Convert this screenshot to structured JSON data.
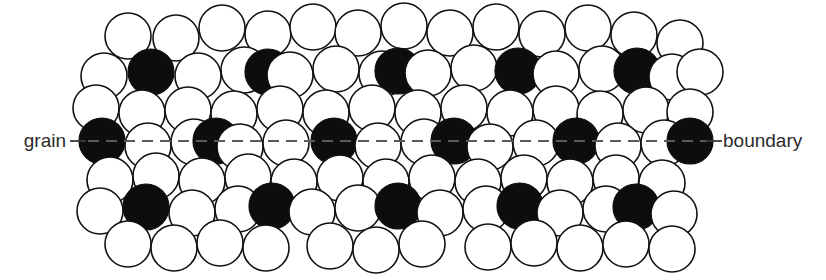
{
  "figure": {
    "width": 826,
    "height": 280,
    "background_color": "#ffffff"
  },
  "labels": {
    "left": {
      "text": "grain",
      "x": 66,
      "y": 147,
      "color": "#2b2b2b",
      "font_size": 19
    },
    "right": {
      "text": "boundary",
      "x": 723,
      "y": 147,
      "color": "#2b2b2b",
      "font_size": 19
    }
  },
  "leaders": {
    "color": "#3a3a3a",
    "left": {
      "x1": 70,
      "y1": 141,
      "x2": 86,
      "y2": 141
    },
    "right": {
      "x1": 706,
      "y1": 141,
      "x2": 722,
      "y2": 141
    }
  },
  "boundary_line": {
    "label": "grain boundary plane",
    "y": 141,
    "x_start": 88,
    "x_end": 706,
    "color": "#5a5a5a",
    "dash_pattern": "11 7",
    "stroke_width": 1.8
  },
  "atom_style": {
    "radius": 23,
    "open_fill": "#ffffff",
    "open_stroke": "#111111",
    "filled_fill": "#0d0d0d",
    "filled_stroke": "#0d0d0d"
  },
  "atoms": [
    {
      "cx": 128,
      "cy": 36,
      "filled": false
    },
    {
      "cx": 176,
      "cy": 38,
      "filled": false
    },
    {
      "cx": 222,
      "cy": 28,
      "filled": false
    },
    {
      "cx": 268,
      "cy": 34,
      "filled": false
    },
    {
      "cx": 313,
      "cy": 27,
      "filled": false
    },
    {
      "cx": 358,
      "cy": 33,
      "filled": false
    },
    {
      "cx": 404,
      "cy": 26,
      "filled": false
    },
    {
      "cx": 450,
      "cy": 33,
      "filled": false
    },
    {
      "cx": 496,
      "cy": 27,
      "filled": false
    },
    {
      "cx": 542,
      "cy": 34,
      "filled": false
    },
    {
      "cx": 588,
      "cy": 28,
      "filled": false
    },
    {
      "cx": 634,
      "cy": 35,
      "filled": false
    },
    {
      "cx": 680,
      "cy": 43,
      "filled": false
    },
    {
      "cx": 104,
      "cy": 76,
      "filled": false
    },
    {
      "cx": 151,
      "cy": 72,
      "filled": true
    },
    {
      "cx": 198,
      "cy": 76,
      "filled": false
    },
    {
      "cx": 244,
      "cy": 70,
      "filled": false
    },
    {
      "cx": 268,
      "cy": 72,
      "filled": true
    },
    {
      "cx": 290,
      "cy": 75,
      "filled": false
    },
    {
      "cx": 336,
      "cy": 69,
      "filled": false
    },
    {
      "cx": 382,
      "cy": 74,
      "filled": false
    },
    {
      "cx": 398,
      "cy": 71,
      "filled": true
    },
    {
      "cx": 428,
      "cy": 73,
      "filled": false
    },
    {
      "cx": 474,
      "cy": 68,
      "filled": false
    },
    {
      "cx": 518,
      "cy": 71,
      "filled": true
    },
    {
      "cx": 556,
      "cy": 74,
      "filled": false
    },
    {
      "cx": 602,
      "cy": 69,
      "filled": false
    },
    {
      "cx": 637,
      "cy": 71,
      "filled": true
    },
    {
      "cx": 672,
      "cy": 77,
      "filled": false
    },
    {
      "cx": 700,
      "cy": 72,
      "filled": false
    },
    {
      "cx": 96,
      "cy": 108,
      "filled": false
    },
    {
      "cx": 142,
      "cy": 113,
      "filled": false
    },
    {
      "cx": 188,
      "cy": 110,
      "filled": false
    },
    {
      "cx": 234,
      "cy": 114,
      "filled": false
    },
    {
      "cx": 280,
      "cy": 109,
      "filled": false
    },
    {
      "cx": 326,
      "cy": 113,
      "filled": false
    },
    {
      "cx": 372,
      "cy": 108,
      "filled": false
    },
    {
      "cx": 418,
      "cy": 113,
      "filled": false
    },
    {
      "cx": 464,
      "cy": 108,
      "filled": false
    },
    {
      "cx": 510,
      "cy": 113,
      "filled": false
    },
    {
      "cx": 556,
      "cy": 109,
      "filled": false
    },
    {
      "cx": 600,
      "cy": 114,
      "filled": false
    },
    {
      "cx": 646,
      "cy": 110,
      "filled": false
    },
    {
      "cx": 690,
      "cy": 112,
      "filled": false
    },
    {
      "cx": 102,
      "cy": 141,
      "filled": true
    },
    {
      "cx": 148,
      "cy": 146,
      "filled": false
    },
    {
      "cx": 194,
      "cy": 142,
      "filled": false
    },
    {
      "cx": 216,
      "cy": 141,
      "filled": true
    },
    {
      "cx": 240,
      "cy": 147,
      "filled": false
    },
    {
      "cx": 286,
      "cy": 143,
      "filled": false
    },
    {
      "cx": 334,
      "cy": 141,
      "filled": true
    },
    {
      "cx": 378,
      "cy": 146,
      "filled": false
    },
    {
      "cx": 424,
      "cy": 142,
      "filled": false
    },
    {
      "cx": 454,
      "cy": 141,
      "filled": true
    },
    {
      "cx": 490,
      "cy": 147,
      "filled": false
    },
    {
      "cx": 536,
      "cy": 143,
      "filled": false
    },
    {
      "cx": 576,
      "cy": 141,
      "filled": true
    },
    {
      "cx": 618,
      "cy": 146,
      "filled": false
    },
    {
      "cx": 664,
      "cy": 143,
      "filled": false
    },
    {
      "cx": 690,
      "cy": 141,
      "filled": true
    },
    {
      "cx": 110,
      "cy": 180,
      "filled": false
    },
    {
      "cx": 156,
      "cy": 176,
      "filled": false
    },
    {
      "cx": 202,
      "cy": 181,
      "filled": false
    },
    {
      "cx": 248,
      "cy": 177,
      "filled": false
    },
    {
      "cx": 294,
      "cy": 182,
      "filled": false
    },
    {
      "cx": 340,
      "cy": 178,
      "filled": false
    },
    {
      "cx": 386,
      "cy": 182,
      "filled": false
    },
    {
      "cx": 432,
      "cy": 178,
      "filled": false
    },
    {
      "cx": 478,
      "cy": 182,
      "filled": false
    },
    {
      "cx": 524,
      "cy": 178,
      "filled": false
    },
    {
      "cx": 570,
      "cy": 182,
      "filled": false
    },
    {
      "cx": 616,
      "cy": 178,
      "filled": false
    },
    {
      "cx": 662,
      "cy": 183,
      "filled": false
    },
    {
      "cx": 100,
      "cy": 211,
      "filled": false
    },
    {
      "cx": 146,
      "cy": 207,
      "filled": true
    },
    {
      "cx": 192,
      "cy": 213,
      "filled": false
    },
    {
      "cx": 238,
      "cy": 209,
      "filled": false
    },
    {
      "cx": 272,
      "cy": 206,
      "filled": true
    },
    {
      "cx": 312,
      "cy": 212,
      "filled": false
    },
    {
      "cx": 358,
      "cy": 208,
      "filled": false
    },
    {
      "cx": 398,
      "cy": 206,
      "filled": true
    },
    {
      "cx": 440,
      "cy": 213,
      "filled": false
    },
    {
      "cx": 486,
      "cy": 209,
      "filled": false
    },
    {
      "cx": 520,
      "cy": 206,
      "filled": true
    },
    {
      "cx": 560,
      "cy": 213,
      "filled": false
    },
    {
      "cx": 606,
      "cy": 209,
      "filled": false
    },
    {
      "cx": 636,
      "cy": 207,
      "filled": true
    },
    {
      "cx": 674,
      "cy": 214,
      "filled": false
    },
    {
      "cx": 128,
      "cy": 244,
      "filled": false
    },
    {
      "cx": 174,
      "cy": 248,
      "filled": false
    },
    {
      "cx": 220,
      "cy": 243,
      "filled": false
    },
    {
      "cx": 266,
      "cy": 248,
      "filled": false
    },
    {
      "cx": 330,
      "cy": 246,
      "filled": false
    },
    {
      "cx": 376,
      "cy": 250,
      "filled": false
    },
    {
      "cx": 422,
      "cy": 244,
      "filled": false
    },
    {
      "cx": 488,
      "cy": 247,
      "filled": false
    },
    {
      "cx": 534,
      "cy": 243,
      "filled": false
    },
    {
      "cx": 580,
      "cy": 248,
      "filled": false
    },
    {
      "cx": 626,
      "cy": 244,
      "filled": false
    },
    {
      "cx": 672,
      "cy": 249,
      "filled": false
    }
  ]
}
